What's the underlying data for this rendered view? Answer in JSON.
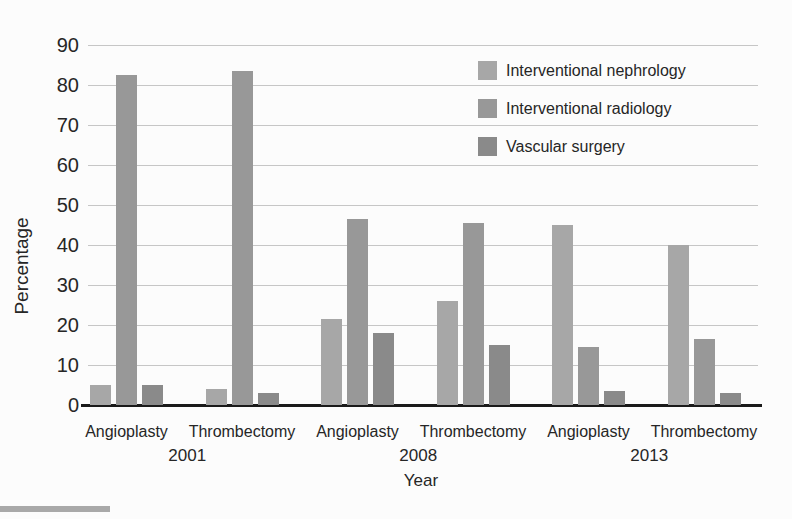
{
  "figure": {
    "background_color": "#fcfcfc",
    "text_color": "#262626",
    "gridline_color": "#c6c6c6",
    "baseline_color": "#1a1a1a",
    "scan_artifact_color": "#a9a9a9"
  },
  "chart_data": {
    "type": "bar",
    "title": "",
    "xlabel": "Year",
    "ylabel": "Percentage",
    "ylim": [
      0,
      90
    ],
    "ytick_step": 10,
    "grid": true,
    "legend_position": "top-right-inside",
    "categories": [
      "Angioplasty",
      "Thrombectomy",
      "Angioplasty",
      "Thrombectomy",
      "Angioplasty",
      "Thrombectomy"
    ],
    "year_groups": [
      {
        "label": "2001",
        "category_indexes": [
          0,
          1
        ]
      },
      {
        "label": "2008",
        "category_indexes": [
          2,
          3
        ]
      },
      {
        "label": "2013",
        "category_indexes": [
          4,
          5
        ]
      }
    ],
    "series": [
      {
        "name": "Interventional nephrology",
        "color": "#a7a7a7",
        "values": [
          5,
          4,
          21.5,
          26,
          45,
          40
        ]
      },
      {
        "name": "Interventional radiology",
        "color": "#989898",
        "values": [
          82.5,
          83.5,
          46.5,
          45.5,
          14.5,
          16.5
        ]
      },
      {
        "name": "Vascular surgery",
        "color": "#8a8a8a",
        "values": [
          5,
          3,
          18,
          15,
          3.5,
          3
        ]
      }
    ]
  }
}
